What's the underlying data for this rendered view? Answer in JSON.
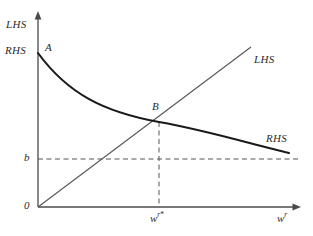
{
  "figure": {
    "type": "economics-equilibrium-diagram",
    "background": "#ffffff",
    "width": 313,
    "height": 236
  },
  "axes": {
    "x": {
      "label": "w",
      "label_superscript": "r",
      "origin_label": "0",
      "arrow": true,
      "tick_label": "w",
      "tick_superscript": "r",
      "tick_star": "*"
    },
    "y": {
      "top_label": "LHS",
      "intercept_label": "RHS",
      "tick_label": "b",
      "arrow": true
    }
  },
  "series": [
    {
      "name": "RHS",
      "kind": "curve",
      "shape": "decreasing-convex-asymptotic",
      "label": "RHS",
      "label_at_axis": "RHS",
      "color": "#1a1a1a",
      "stroke_width": 2.1,
      "start_point_label": "A",
      "asymptote_label": "b"
    },
    {
      "name": "LHS",
      "kind": "line",
      "shape": "increasing-linear-through-origin",
      "label": "LHS",
      "label_at_axis": "LHS",
      "color": "#4a4a4a",
      "stroke_width": 1.0
    }
  ],
  "points": [
    {
      "id": "A",
      "label": "A",
      "description": "RHS curve vertical intercept"
    },
    {
      "id": "B",
      "label": "B",
      "description": "intersection of LHS line and RHS curve"
    }
  ],
  "guides": [
    {
      "id": "b-line",
      "label": "b",
      "orientation": "horizontal",
      "style": "dashed",
      "description": "RHS asymptote level b"
    },
    {
      "id": "wstar-line",
      "label": "w r *",
      "orientation": "vertical",
      "style": "dashed",
      "description": "equilibrium wage at point B"
    }
  ],
  "colors": {
    "axis": "#4a4a4a",
    "curve_rhs": "#1a1a1a",
    "line_lhs": "#555555",
    "dashed_guide": "#555555",
    "text": "#2b2b2b"
  }
}
